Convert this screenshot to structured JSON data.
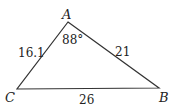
{
  "diagram": {
    "type": "triangle",
    "vertices": {
      "A": {
        "label": "A",
        "x": 68,
        "y": 22
      },
      "B": {
        "label": "B",
        "x": 159,
        "y": 88
      },
      "C": {
        "label": "C",
        "x": 17,
        "y": 89
      }
    },
    "angle_A": "88°",
    "sides": {
      "AC": "16.1",
      "AB": "21",
      "CB": "26"
    },
    "stroke_color": "#333333"
  }
}
